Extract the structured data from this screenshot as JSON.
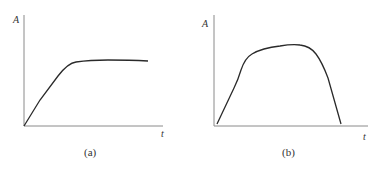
{
  "figure": {
    "panels": [
      {
        "id": "a",
        "caption": "(a)",
        "y_axis_label": "A",
        "x_axis_label": "t",
        "description": "Curve rises linearly from origin, then levels off to a plateau"
      },
      {
        "id": "b",
        "caption": "(b)",
        "y_axis_label": "A",
        "x_axis_label": "t",
        "description": "Curve rises from origin to a rounded peak, then falls back to zero"
      }
    ],
    "colors": {
      "axis": "#8a8a8a",
      "curve": "#2a2a2a",
      "text": "#333333"
    }
  }
}
